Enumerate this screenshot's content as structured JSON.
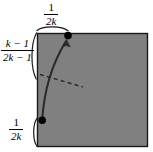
{
  "figure": {
    "background_color": "#ffffff",
    "square": {
      "fill_color": "#808080",
      "stroke_color": "#000000",
      "x": 37,
      "y": 33,
      "width": 111,
      "height": 114
    },
    "labels": {
      "top": {
        "numerator": "1",
        "denominator": "2k",
        "meaning": "distance-from-top-left-corner-to-upper-point"
      },
      "left": {
        "numerator": "k − 1",
        "denominator": "2k − 1",
        "meaning": "vertical-span-between-marked-points"
      },
      "bottom": {
        "numerator": "1",
        "denominator": "2k",
        "meaning": "distance-from-bottom-left-corner-to-lower-point"
      }
    },
    "points": [
      {
        "name": "upper-point",
        "x": 68,
        "y": 36,
        "radius": 3.6,
        "color": "#000000"
      },
      {
        "name": "lower-point",
        "x": 42,
        "y": 120,
        "radius": 3.6,
        "color": "#000000"
      }
    ],
    "curve": {
      "name": "solid-curve-with-arrowhead",
      "color": "#2b2b2b",
      "from": [
        42,
        120
      ],
      "to": [
        66,
        40
      ],
      "has_arrowhead": true
    },
    "dashed_line": {
      "name": "dashed-tangent-line",
      "color": "#2b2b2b",
      "from": [
        40,
        75
      ],
      "to": [
        83,
        87
      ],
      "dash_pattern": "4 3"
    },
    "braces": [
      {
        "name": "top-brace",
        "orientation": "horizontal"
      },
      {
        "name": "left-brace",
        "orientation": "vertical"
      },
      {
        "name": "bottom-brace",
        "orientation": "vertical-small"
      }
    ]
  }
}
